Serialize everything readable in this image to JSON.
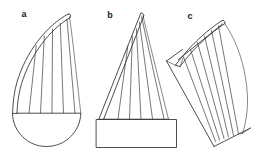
{
  "figure": {
    "background_color": "#ffffff",
    "stroke_color": "#3a3a3a",
    "label_color": "#1a1a1a",
    "width": 261,
    "height": 158,
    "panels": [
      {
        "id": "a",
        "label": "a",
        "label_x": 24,
        "label_y": 15,
        "description": "Curved-spine sail with vertical ribs over a semicircular hull",
        "rib_count": 5
      },
      {
        "id": "b",
        "label": "b",
        "label_x": 110,
        "label_y": 16,
        "description": "Triangular sail with vertical ribs above a rectangular base box",
        "rib_count": 5
      },
      {
        "id": "c",
        "label": "c",
        "label_x": 190,
        "label_y": 17,
        "description": "Rotated curved sail with ribs, tilted diagonally",
        "rib_count": 6
      }
    ]
  }
}
